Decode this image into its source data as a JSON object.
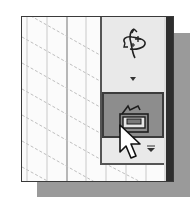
{
  "window": {
    "background": "#fbfbfb",
    "border_color": "#3a3a3a",
    "shadow_color": "#9a9a9a"
  },
  "canvas": {
    "grid": "isometric-grid",
    "line_color": "#c8c8c8"
  },
  "toolbar": {
    "buttons": [
      {
        "name": "rotate-view",
        "icon": "rotate-3d-icon",
        "state": "normal"
      },
      {
        "name": "more-views",
        "icon": "chevron-down-icon",
        "state": "normal"
      },
      {
        "name": "display-style",
        "icon": "display-style-icon",
        "state": "hover",
        "highlight_color": "#8d8d8d"
      },
      {
        "name": "display-style-flyout",
        "icon": "flyout-arrow-icon",
        "state": "normal"
      }
    ]
  },
  "cursor": {
    "icon": "mouse-pointer-icon",
    "over": "display-style"
  }
}
